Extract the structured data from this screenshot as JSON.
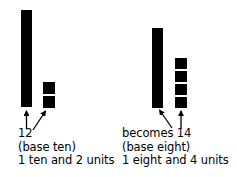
{
  "figure": {
    "background_color": "#ffffff",
    "ink_color": "#000000",
    "width": 237,
    "height": 177
  },
  "left_group": {
    "name": "base-ten-representation",
    "rod_label": "ten-rod",
    "rod_count": 1,
    "unit_count": 2,
    "number": "12",
    "base_line": "(base ten)",
    "decomposition_line": "1 ten and 2 units",
    "arrows": [
      {
        "name": "arrow-to-ten-rod",
        "direction": "up",
        "points_to": "ten-rod"
      },
      {
        "name": "arrow-to-ten-units",
        "direction": "up-right",
        "points_to": "unit-squares"
      }
    ]
  },
  "right_group": {
    "name": "base-eight-representation",
    "rod_label": "eight-rod",
    "rod_count": 1,
    "unit_count": 4,
    "number": "becomes 14",
    "base_line": "(base eight)",
    "decomposition_line": "1 eight and 4 units",
    "arrows": [
      {
        "name": "arrow-to-eight-rod",
        "direction": "up-left",
        "points_to": "eight-rod"
      },
      {
        "name": "arrow-to-eight-units",
        "direction": "up",
        "points_to": "unit-squares"
      }
    ]
  }
}
